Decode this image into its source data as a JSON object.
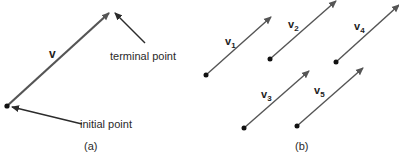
{
  "colors": {
    "vector": "#555555",
    "pointer": "#2b2b2b",
    "dot": "#111111",
    "text": "#2a2a2a",
    "background": "#ffffff"
  },
  "panel_a": {
    "caption": "(a)",
    "vector_label": "v",
    "terminal_label": "terminal point",
    "initial_label": "initial point"
  },
  "panel_b": {
    "caption": "(b)",
    "vectors": [
      {
        "name": "v",
        "sub": "1"
      },
      {
        "name": "v",
        "sub": "2"
      },
      {
        "name": "v",
        "sub": "3"
      },
      {
        "name": "v",
        "sub": "4"
      },
      {
        "name": "v",
        "sub": "5"
      }
    ]
  }
}
